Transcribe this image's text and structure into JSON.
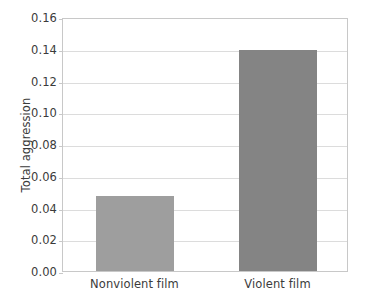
{
  "chart_data": {
    "type": "bar",
    "title": "",
    "subtitle": "",
    "xlabel": "",
    "ylabel": "Total aggression",
    "categories": [
      "Nonviolent film",
      "Violent film"
    ],
    "values": [
      0.047,
      0.139
    ],
    "series": [
      {
        "name": "Total aggression",
        "values": [
          0.047,
          0.139
        ]
      }
    ],
    "ylim": [
      0.0,
      0.16
    ],
    "ytick_labels": [
      "0.00",
      "0.02",
      "0.04",
      "0.06",
      "0.08",
      "0.10",
      "0.12",
      "0.14",
      "0.16"
    ],
    "ytick_values": [
      0.0,
      0.02,
      0.04,
      0.06,
      0.08,
      0.1,
      0.12,
      0.14,
      0.16
    ],
    "grid": true,
    "legend": false,
    "legend_position": "none",
    "bar_colors": [
      "#9e9e9e",
      "#848484"
    ],
    "plot_background": "#ffffff",
    "grid_color": "#dcdcdc",
    "axis_color": "#c8c8c8",
    "text_color": "#3b3b3b"
  }
}
